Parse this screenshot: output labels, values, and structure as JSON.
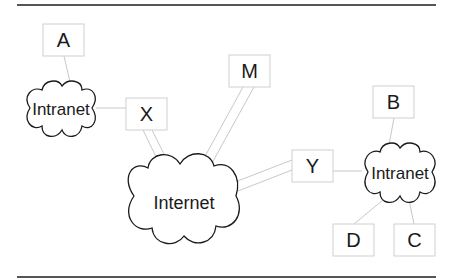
{
  "diagram": {
    "type": "network-topology",
    "nodes": {
      "A": {
        "label": "A",
        "kind": "host"
      },
      "B": {
        "label": "B",
        "kind": "host"
      },
      "C": {
        "label": "C",
        "kind": "host"
      },
      "D": {
        "label": "D",
        "kind": "host"
      },
      "M": {
        "label": "M",
        "kind": "host"
      },
      "X": {
        "label": "X",
        "kind": "gateway"
      },
      "Y": {
        "label": "Y",
        "kind": "gateway"
      }
    },
    "clouds": {
      "intranet_left": {
        "label": "Intranet"
      },
      "internet": {
        "label": "Internet"
      },
      "intranet_right": {
        "label": "Intranet"
      }
    },
    "edges": [
      {
        "from": "A",
        "to": "intranet_left",
        "style": "single"
      },
      {
        "from": "intranet_left",
        "to": "X",
        "style": "single"
      },
      {
        "from": "X",
        "to": "internet",
        "style": "double"
      },
      {
        "from": "M",
        "to": "internet",
        "style": "double"
      },
      {
        "from": "Y",
        "to": "internet",
        "style": "double"
      },
      {
        "from": "Y",
        "to": "intranet_right",
        "style": "single"
      },
      {
        "from": "B",
        "to": "intranet_right",
        "style": "single"
      },
      {
        "from": "D",
        "to": "intranet_right",
        "style": "single"
      },
      {
        "from": "C",
        "to": "intranet_right",
        "style": "single"
      }
    ],
    "colors": {
      "rule": "#555555",
      "link": "#c8c8c8",
      "box_border": "#cfcfcf",
      "cloud_border": "#1a1a1a",
      "text": "#1a1a1a"
    }
  }
}
